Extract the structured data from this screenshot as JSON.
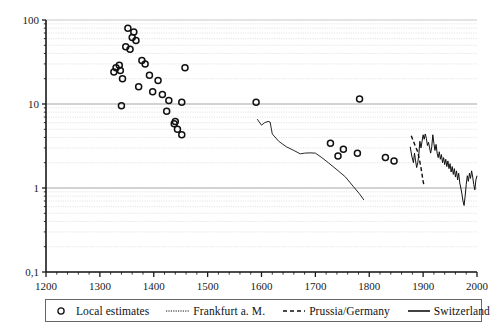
{
  "chart_data": {
    "type": "scatter",
    "title": "",
    "xlabel": "",
    "ylabel": "",
    "xlim": [
      1200,
      2000
    ],
    "ylim": [
      0.1,
      100
    ],
    "yscale": "log",
    "xscale": "linear",
    "grid": "horizontal-minor-log",
    "legend_position": "bottom",
    "xticks": [
      1200,
      1300,
      1400,
      1500,
      1600,
      1700,
      1800,
      1900,
      2000
    ],
    "xtick_labels": [
      "1200",
      "1300",
      "1400",
      "1500",
      "1600",
      "1700",
      "1800",
      "1900",
      "2000"
    ],
    "yticks": [
      0.1,
      1,
      10,
      100
    ],
    "ytick_labels": [
      "0,1",
      "1",
      "10",
      "100"
    ],
    "xminor_interval": 20,
    "series": [
      {
        "name": "Local estimates",
        "style": "open-circle-markers",
        "points": [
          [
            1352,
            80
          ],
          [
            1360,
            62
          ],
          [
            1363,
            72
          ],
          [
            1367,
            57
          ],
          [
            1348,
            48
          ],
          [
            1356,
            45
          ],
          [
            1330,
            27
          ],
          [
            1336,
            29
          ],
          [
            1338,
            25
          ],
          [
            1326,
            24
          ],
          [
            1342,
            20
          ],
          [
            1378,
            33
          ],
          [
            1384,
            30
          ],
          [
            1392,
            22
          ],
          [
            1408,
            19
          ],
          [
            1372,
            16
          ],
          [
            1398,
            14
          ],
          [
            1416,
            13
          ],
          [
            1428,
            11
          ],
          [
            1458,
            27
          ],
          [
            1340,
            9.5
          ],
          [
            1452,
            10.5
          ],
          [
            1424,
            8.2
          ],
          [
            1440,
            6.2
          ],
          [
            1438,
            5.8
          ],
          [
            1444,
            5.0
          ],
          [
            1452,
            4.3
          ],
          [
            1590,
            10.5
          ],
          [
            1728,
            3.4
          ],
          [
            1752,
            2.9
          ],
          [
            1742,
            2.4
          ],
          [
            1782,
            11.5
          ],
          [
            1778,
            2.6
          ],
          [
            1830,
            2.3
          ],
          [
            1846,
            2.1
          ]
        ]
      },
      {
        "name": "Frankfurt a. M.",
        "style": "dotted-thin-line",
        "points": [
          [
            1592,
            6.6
          ],
          [
            1600,
            5.6
          ],
          [
            1606,
            6.0
          ],
          [
            1612,
            6.2
          ],
          [
            1616,
            6.1
          ],
          [
            1620,
            4.4
          ],
          [
            1632,
            3.6
          ],
          [
            1646,
            3.1
          ],
          [
            1660,
            2.8
          ],
          [
            1672,
            2.55
          ],
          [
            1680,
            2.6
          ],
          [
            1690,
            2.62
          ],
          [
            1700,
            2.6
          ],
          [
            1712,
            2.3
          ],
          [
            1724,
            2.0
          ],
          [
            1740,
            1.65
          ],
          [
            1756,
            1.35
          ],
          [
            1770,
            1.05
          ],
          [
            1782,
            0.85
          ],
          [
            1790,
            0.72
          ]
        ]
      },
      {
        "name": "Prussia/Germany",
        "style": "dashed-line",
        "points": [
          [
            1878,
            4.2
          ],
          [
            1882,
            3.6
          ],
          [
            1886,
            3.1
          ],
          [
            1890,
            2.7
          ],
          [
            1893,
            2.2
          ],
          [
            1896,
            1.75
          ],
          [
            1898,
            1.45
          ],
          [
            1900,
            1.2
          ],
          [
            1902,
            1.05
          ]
        ]
      },
      {
        "name": "Switzerland",
        "style": "solid-line",
        "points": [
          [
            1876,
            3.1
          ],
          [
            1879,
            2.4
          ],
          [
            1882,
            2.0
          ],
          [
            1884,
            2.6
          ],
          [
            1886,
            2.1
          ],
          [
            1888,
            1.75
          ],
          [
            1890,
            2.0
          ],
          [
            1892,
            2.5
          ],
          [
            1894,
            3.6
          ],
          [
            1896,
            3.0
          ],
          [
            1898,
            3.6
          ],
          [
            1900,
            4.3
          ],
          [
            1902,
            3.8
          ],
          [
            1904,
            4.4
          ],
          [
            1906,
            3.9
          ],
          [
            1908,
            3.2
          ],
          [
            1910,
            3.5
          ],
          [
            1912,
            3.0
          ],
          [
            1914,
            2.6
          ],
          [
            1916,
            3.1
          ],
          [
            1918,
            4.3
          ],
          [
            1920,
            3.4
          ],
          [
            1922,
            2.8
          ],
          [
            1924,
            3.3
          ],
          [
            1926,
            2.6
          ],
          [
            1928,
            2.3
          ],
          [
            1930,
            2.7
          ],
          [
            1932,
            2.2
          ],
          [
            1934,
            2.5
          ],
          [
            1936,
            2.0
          ],
          [
            1938,
            2.3
          ],
          [
            1940,
            1.9
          ],
          [
            1942,
            2.2
          ],
          [
            1944,
            1.8
          ],
          [
            1946,
            2.1
          ],
          [
            1948,
            1.7
          ],
          [
            1950,
            1.95
          ],
          [
            1952,
            1.55
          ],
          [
            1954,
            1.8
          ],
          [
            1956,
            1.45
          ],
          [
            1958,
            1.7
          ],
          [
            1960,
            1.35
          ],
          [
            1962,
            1.6
          ],
          [
            1964,
            1.25
          ],
          [
            1966,
            1.5
          ],
          [
            1968,
            1.15
          ],
          [
            1970,
            1.0
          ],
          [
            1972,
            0.85
          ],
          [
            1974,
            0.7
          ],
          [
            1976,
            0.62
          ],
          [
            1978,
            0.8
          ],
          [
            1980,
            1.1
          ],
          [
            1982,
            1.4
          ],
          [
            1984,
            1.2
          ],
          [
            1986,
            1.5
          ],
          [
            1988,
            1.3
          ],
          [
            1990,
            1.6
          ],
          [
            1992,
            1.35
          ],
          [
            1994,
            1.1
          ],
          [
            1996,
            0.95
          ],
          [
            1998,
            1.25
          ],
          [
            2000,
            1.4
          ]
        ]
      }
    ]
  },
  "legend": {
    "items": [
      {
        "label": "Local estimates",
        "key": "open-circle"
      },
      {
        "label": "Frankfurt a. M.",
        "key": "dotted-line"
      },
      {
        "label": "Prussia/Germany",
        "key": "dashed-line"
      },
      {
        "label": "Switzerland",
        "key": "solid-line"
      }
    ]
  }
}
